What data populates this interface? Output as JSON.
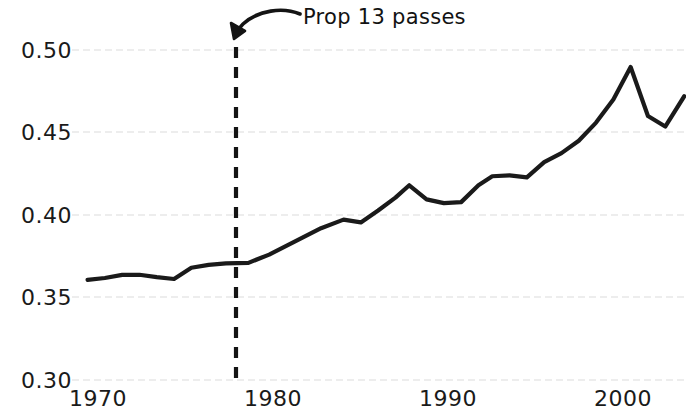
{
  "chart_data": {
    "type": "line",
    "title": "",
    "subtitle": "",
    "xlabel": "",
    "ylabel": "",
    "xlim": [
      1968.1,
      2003.6
    ],
    "ylim": [
      0.3,
      0.5
    ],
    "grid": true,
    "grid_axis": "y",
    "legend": "none",
    "line_color": "#1a1a1a",
    "grid_color": "#e6e6e6",
    "x_ticks": [
      1970,
      1980,
      1990,
      2000
    ],
    "x_tick_labels": [
      "1970",
      "1980",
      "1990",
      "2000"
    ],
    "y_ticks": [
      0.3,
      0.35,
      0.4,
      0.45,
      0.5
    ],
    "y_tick_labels": [
      "0.30",
      "0.35",
      "0.40",
      "0.45",
      "0.50"
    ],
    "series": [
      {
        "name": "share",
        "x": [
          1969.0,
          1970.0,
          1971.0,
          1972.0,
          1973.0,
          1974.0,
          1975.0,
          1976.0,
          1977.0,
          1978.3,
          1979.5,
          1981.0,
          1982.5,
          1983.8,
          1984.8,
          1985.8,
          1986.8,
          1987.6,
          1988.6,
          1989.6,
          1990.6,
          1991.6,
          1992.4,
          1993.4,
          1994.4,
          1995.4,
          1996.4,
          1997.4,
          1998.4,
          1999.4,
          2000.4,
          2001.4,
          2002.4,
          2003.5
        ],
        "values": [
          0.3607,
          0.3618,
          0.3637,
          0.3638,
          0.3623,
          0.3612,
          0.368,
          0.3698,
          0.3707,
          0.371,
          0.376,
          0.384,
          0.392,
          0.3972,
          0.3955,
          0.4027,
          0.4105,
          0.418,
          0.4095,
          0.4072,
          0.4078,
          0.418,
          0.4235,
          0.424,
          0.4228,
          0.432,
          0.4375,
          0.445,
          0.456,
          0.47,
          0.4897,
          0.46,
          0.4536,
          0.472
        ]
      }
    ],
    "annotations": [
      {
        "name": "prop-13-annotation",
        "text": "Prop 13 passes",
        "x_year": 1978.3,
        "marker": "vertical-dashed-line",
        "marker_color": "#141414"
      }
    ]
  },
  "axes": {
    "y_labels": [
      "0.50",
      "0.45",
      "0.40",
      "0.35",
      "0.30"
    ],
    "x_labels": [
      "1970",
      "1980",
      "1990",
      "2000"
    ]
  },
  "annotation": {
    "label": "Prop 13 passes"
  }
}
